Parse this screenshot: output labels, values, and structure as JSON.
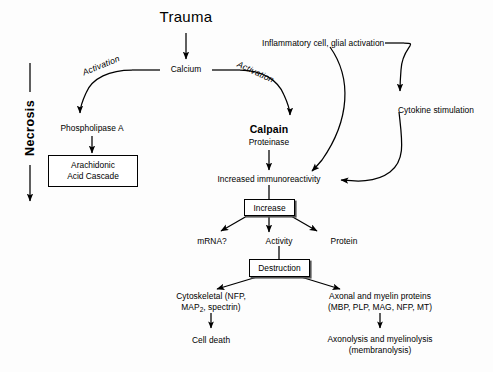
{
  "diagram": {
    "type": "flowchart",
    "background_color": "#fdfdfd",
    "stroke_color": "#000000",
    "width": 493,
    "height": 372,
    "nodes": {
      "trauma": "Trauma",
      "calcium": "Calcium",
      "activation_left": "Activation",
      "activation_right": "Activation",
      "phospholipase": "Phospholipase A",
      "arachidonic_line1": "Arachidonic",
      "arachidonic_line2": "Acid Cascade",
      "necrosis": "Necrosis",
      "calpain": "Calpain",
      "proteinase": "Proteinase",
      "inflammatory": "Inflammatory cell, glial activation",
      "cytokine": "Cytokine stimulation",
      "immunoreactivity": "Increased immunoreactivity",
      "increase_box": "Increase",
      "mrna": "mRNA?",
      "activity": "Activity",
      "protein": "Protein",
      "destruction_box": "Destruction",
      "cytoskeletal_line1": "Cytoskeletal (NFP,",
      "cytoskeletal_line2_a": "MAP",
      "cytoskeletal_line2_sub": "2",
      "cytoskeletal_line2_b": ", spectrin)",
      "cell_death": "Cell death",
      "axonal_line1": "Axonal and myelin proteins",
      "axonal_line2": "(MBP, PLP, MAG, NFP, MT)",
      "axonolysis_line1": "Axonolysis and myelinolysis",
      "axonolysis_line2": "(membranolysis)"
    },
    "edges": [
      {
        "from": "trauma",
        "to": "calcium",
        "style": "straight-arrow-down"
      },
      {
        "from": "calcium",
        "to": "phospholipase",
        "style": "curve-arrow-down-left",
        "label": "Activation"
      },
      {
        "from": "calcium",
        "to": "calpain",
        "style": "curve-arrow-down-right",
        "label": "Activation"
      },
      {
        "from": "phospholipase",
        "to": "arachidonic",
        "style": "straight-arrow-down"
      },
      {
        "from": "calpain",
        "to": "immunoreactivity",
        "style": "straight-arrow-down"
      },
      {
        "from": "inflammatory",
        "to": "immunoreactivity",
        "style": "curve-arrow-down-left"
      },
      {
        "from": "inflammatory",
        "to": "cytokine",
        "style": "curve-arrow-down-right"
      },
      {
        "from": "cytokine",
        "to": "immunoreactivity",
        "style": "curve-arrow-left"
      },
      {
        "from": "immunoreactivity",
        "to": "increase_box",
        "style": "straight-line-down"
      },
      {
        "from": "increase_box",
        "to": "mrna",
        "style": "arrow-down-left"
      },
      {
        "from": "increase_box",
        "to": "activity",
        "style": "arrow-down"
      },
      {
        "from": "increase_box",
        "to": "protein",
        "style": "arrow-down-right"
      },
      {
        "from": "activity",
        "to": "destruction_box",
        "style": "straight-line-down"
      },
      {
        "from": "destruction_box",
        "to": "cytoskeletal",
        "style": "arrow-down-left"
      },
      {
        "from": "destruction_box",
        "to": "axonal",
        "style": "arrow-down-right"
      },
      {
        "from": "cytoskeletal",
        "to": "cell_death",
        "style": "straight-arrow-down"
      },
      {
        "from": "axonal",
        "to": "axonolysis",
        "style": "straight-arrow-down"
      },
      {
        "from": "necrosis_top",
        "to": "necrosis_bottom",
        "style": "vertical-arrow-with-rotated-label"
      }
    ]
  }
}
